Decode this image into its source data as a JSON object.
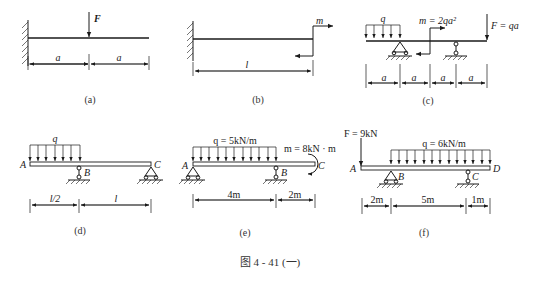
{
  "figure_caption": "图 4 - 41 (一)",
  "diagrams": [
    {
      "id": "a",
      "caption": "(a)",
      "support": "fixed-wall-left",
      "loads": [
        {
          "type": "point-force",
          "label": "F",
          "position": "midspan"
        }
      ],
      "dimensions": [
        "a",
        "a"
      ]
    },
    {
      "id": "b",
      "caption": "(b)",
      "support": "fixed-wall-left",
      "loads": [
        {
          "type": "couple",
          "label": "m",
          "position": "free-end"
        }
      ],
      "dimensions": [
        "l"
      ]
    },
    {
      "id": "c",
      "caption": "(c)",
      "loads": [
        {
          "type": "distributed",
          "label": "q"
        },
        {
          "type": "couple",
          "label": "m = 2qa²"
        },
        {
          "type": "point-force",
          "label": "F = qa"
        }
      ],
      "dimensions": [
        "a",
        "a",
        "a",
        "a"
      ]
    },
    {
      "id": "d",
      "caption": "(d)",
      "points": [
        "A",
        "B",
        "C"
      ],
      "loads": [
        {
          "type": "distributed",
          "label": "q"
        }
      ],
      "dimensions": [
        "l/2",
        "l"
      ]
    },
    {
      "id": "e",
      "caption": "(e)",
      "points": [
        "A",
        "B",
        "C"
      ],
      "loads": [
        {
          "type": "distributed",
          "label": "q = 5kN/m"
        },
        {
          "type": "couple",
          "label": "m = 8kN · m"
        }
      ],
      "dimensions": [
        "4m",
        "2m"
      ]
    },
    {
      "id": "f",
      "caption": "(f)",
      "points": [
        "A",
        "B",
        "C",
        "D"
      ],
      "loads": [
        {
          "type": "point-force",
          "label": "F = 9kN"
        },
        {
          "type": "distributed",
          "label": "q = 6kN/m"
        }
      ],
      "dimensions": [
        "2m",
        "5m",
        "1m"
      ]
    }
  ]
}
